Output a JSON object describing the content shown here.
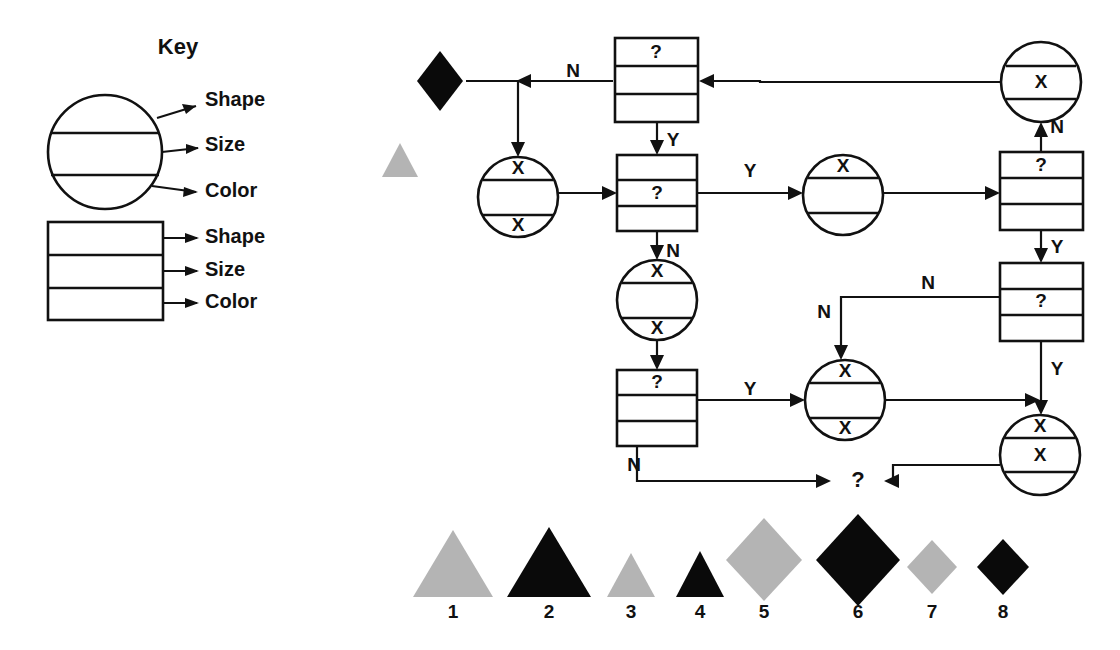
{
  "diagram": {
    "title_visible": "Key",
    "background": "#ffffff",
    "ink": "#111111",
    "gray": "#b4b4b4"
  },
  "key": {
    "title": "Key",
    "circle_labels": [
      "Shape",
      "Size",
      "Color"
    ],
    "box_labels": [
      "Shape",
      "Size",
      "Color"
    ],
    "circle": {
      "cx": 105,
      "cy": 152,
      "r": 57,
      "bands": 3
    },
    "box": {
      "x": 48,
      "y": 222,
      "w": 115,
      "h": 98,
      "rows": 3
    }
  },
  "flow": {
    "nodes": [
      {
        "id": "n-box-top",
        "kind": "box",
        "x": 615,
        "y": 38,
        "w": 83,
        "h": 84,
        "rows": [
          "?",
          "",
          ""
        ]
      },
      {
        "id": "n-box-mid",
        "kind": "box",
        "x": 617,
        "y": 155,
        "w": 80,
        "h": 76,
        "rows": [
          "",
          "?",
          ""
        ]
      },
      {
        "id": "n-box-bottom",
        "kind": "box",
        "x": 617,
        "y": 370,
        "w": 80,
        "h": 76,
        "rows": [
          "?",
          "",
          ""
        ]
      },
      {
        "id": "n-box-right-top",
        "kind": "box",
        "x": 1000,
        "y": 152,
        "w": 83,
        "h": 78,
        "rows": [
          "?",
          "",
          ""
        ]
      },
      {
        "id": "n-box-right-mid",
        "kind": "box",
        "x": 1000,
        "y": 263,
        "w": 83,
        "h": 78,
        "rows": [
          "",
          "?",
          ""
        ]
      },
      {
        "id": "n-circle-left",
        "kind": "circle",
        "cx": 518,
        "cy": 197,
        "r": 40,
        "bands": [
          "X",
          "",
          "X"
        ]
      },
      {
        "id": "n-circle-center",
        "kind": "circle",
        "cx": 657,
        "cy": 300,
        "r": 40,
        "bands": [
          "X",
          "",
          "X"
        ]
      },
      {
        "id": "n-circle-upper",
        "kind": "circle",
        "cx": 843,
        "cy": 195,
        "r": 40,
        "bands": [
          "X",
          "",
          ""
        ]
      },
      {
        "id": "n-circle-lower",
        "kind": "circle",
        "cx": 845,
        "cy": 400,
        "r": 40,
        "bands": [
          "X",
          "",
          "X"
        ]
      },
      {
        "id": "n-circle-rtop",
        "kind": "circle",
        "cx": 1041,
        "cy": 82,
        "r": 40,
        "bands": [
          "",
          "X",
          ""
        ]
      },
      {
        "id": "n-circle-rbottom",
        "kind": "circle",
        "cx": 1040,
        "cy": 455,
        "r": 40,
        "bands": [
          "X",
          "X",
          ""
        ]
      }
    ],
    "edge_labels": [
      {
        "text": "N",
        "x": 573,
        "y": 72
      },
      {
        "text": "Y",
        "x": 673,
        "y": 141
      },
      {
        "text": "Y",
        "x": 750,
        "y": 172
      },
      {
        "text": "N",
        "x": 673,
        "y": 252
      },
      {
        "text": "N",
        "x": 1057,
        "y": 128
      },
      {
        "text": "Y",
        "x": 1057,
        "y": 248
      },
      {
        "text": "N",
        "x": 928,
        "y": 284
      },
      {
        "text": "N",
        "x": 824,
        "y": 313
      },
      {
        "text": "Y",
        "x": 750,
        "y": 390
      },
      {
        "text": "Y",
        "x": 1057,
        "y": 370
      },
      {
        "text": "N",
        "x": 634,
        "y": 466
      }
    ],
    "terminal": {
      "text": "?",
      "x": 858,
      "y": 481
    },
    "loose_shapes": [
      {
        "id": "loose-diamond-black",
        "kind": "diamond",
        "cx": 440,
        "cy": 81,
        "rx": 23,
        "ry": 30,
        "color": "black"
      },
      {
        "id": "loose-triangle-gray",
        "kind": "triangle",
        "cx": 400,
        "cy": 160,
        "w": 36,
        "h": 34,
        "color": "gray"
      }
    ]
  },
  "legend": {
    "items": [
      {
        "number": "1",
        "shape": "triangle",
        "size": "large",
        "color": "gray",
        "cx": 453,
        "cy": 563
      },
      {
        "number": "2",
        "shape": "triangle",
        "size": "large",
        "color": "black",
        "cx": 549,
        "cy": 563
      },
      {
        "number": "3",
        "shape": "triangle",
        "size": "small",
        "color": "gray",
        "cx": 631,
        "cy": 573
      },
      {
        "number": "4",
        "shape": "triangle",
        "size": "small",
        "color": "black",
        "cx": 700,
        "cy": 573
      },
      {
        "number": "5",
        "shape": "diamond",
        "size": "large",
        "color": "gray",
        "cx": 764,
        "cy": 560
      },
      {
        "number": "6",
        "shape": "diamond",
        "size": "large",
        "color": "black",
        "cx": 858,
        "cy": 560
      },
      {
        "number": "7",
        "shape": "diamond",
        "size": "small",
        "color": "gray",
        "cx": 932,
        "cy": 566
      },
      {
        "number": "8",
        "shape": "diamond",
        "size": "small",
        "color": "black",
        "cx": 1003,
        "cy": 566
      }
    ],
    "label_y": 613
  }
}
